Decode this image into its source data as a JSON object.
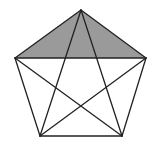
{
  "figure": {
    "type": "regular-pentagon-with-diagonals",
    "width": 159,
    "height": 150,
    "vertices": {
      "A": [
        81,
        10
      ],
      "B": [
        146,
        58
      ],
      "C": [
        122,
        136
      ],
      "D": [
        40,
        136
      ],
      "E": [
        15,
        58
      ]
    },
    "shaded_region": [
      "A",
      "B",
      "E"
    ],
    "colors": {
      "background": "#ffffff",
      "stroke": "#222222",
      "shade": "#9a9a9a"
    },
    "stroke_width": 1.3,
    "sides": [
      [
        "A",
        "B"
      ],
      [
        "B",
        "C"
      ],
      [
        "C",
        "D"
      ],
      [
        "D",
        "E"
      ],
      [
        "E",
        "A"
      ]
    ],
    "diagonals": [
      [
        "A",
        "C"
      ],
      [
        "A",
        "D"
      ],
      [
        "B",
        "D"
      ],
      [
        "B",
        "E"
      ],
      [
        "C",
        "E"
      ]
    ]
  }
}
